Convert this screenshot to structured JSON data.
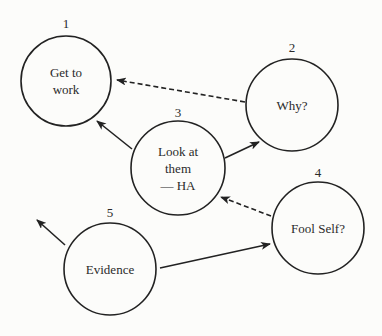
{
  "diagram": {
    "colors": {
      "background": "#fcfcfa",
      "ink": "#222222"
    },
    "nodes": [
      {
        "id": "1",
        "number": "1",
        "lines": [
          "Get to",
          "work"
        ],
        "cx": 66,
        "cy": 81,
        "r": 45,
        "number_y": 28
      },
      {
        "id": "2",
        "number": "2",
        "lines": [
          "Why?"
        ],
        "cx": 292,
        "cy": 105,
        "r": 46,
        "number_y": 52
      },
      {
        "id": "3",
        "number": "3",
        "lines": [
          "Look at",
          "them",
          "— HA"
        ],
        "cx": 178,
        "cy": 168,
        "r": 47,
        "number_y": 117
      },
      {
        "id": "4",
        "number": "4",
        "lines": [
          "Fool Self?"
        ],
        "cx": 318,
        "cy": 228,
        "r": 46,
        "number_y": 177
      },
      {
        "id": "5",
        "number": "5",
        "lines": [
          "Evidence"
        ],
        "cx": 110,
        "cy": 269,
        "r": 46,
        "number_y": 217
      }
    ],
    "edges": [
      {
        "from": "2",
        "to": "1",
        "style": "dashed",
        "x1": 245,
        "y1": 102,
        "x2": 117,
        "y2": 80
      },
      {
        "from": "3",
        "to": "1",
        "style": "solid",
        "x1": 132,
        "y1": 149,
        "x2": 97,
        "y2": 121
      },
      {
        "from": "3",
        "to": "2",
        "style": "solid",
        "x1": 225,
        "y1": 158,
        "x2": 259,
        "y2": 142
      },
      {
        "from": "4",
        "to": "3",
        "style": "dashed",
        "x1": 271,
        "y1": 216,
        "x2": 221,
        "y2": 197
      },
      {
        "from": "5",
        "to": "4",
        "style": "solid",
        "x1": 160,
        "y1": 268,
        "x2": 270,
        "y2": 244
      },
      {
        "from": "5",
        "to": "outside",
        "style": "solid",
        "x1": 65,
        "y1": 245,
        "x2": 37,
        "y2": 220
      }
    ]
  }
}
